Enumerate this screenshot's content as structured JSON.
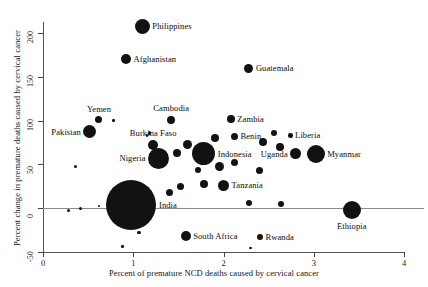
{
  "chart_data": {
    "type": "scatter",
    "title": "",
    "xlabel": "Percent of premature NCD deaths caused by cervical cancer",
    "ylabel": "Percent change in premature deaths caused by cervical cancer",
    "xlim": [
      0,
      4
    ],
    "ylim": [
      -50,
      200
    ],
    "xticks": [
      "0",
      "1",
      "2",
      "3",
      "4"
    ],
    "yticks": [
      "-50",
      "0",
      "50",
      "100",
      "150",
      "200"
    ],
    "grid": false,
    "legend": "none",
    "reference_line_y": 0,
    "marker_color": "#121212",
    "bubble_size_encodes": "population",
    "points": [
      {
        "label": "Philippines",
        "x": 1.1,
        "y": 208,
        "r": 7.5,
        "label_pos": "right"
      },
      {
        "label": "Afghanistan",
        "x": 0.92,
        "y": 170,
        "r": 5.0,
        "label_pos": "right"
      },
      {
        "label": "Guatemala",
        "x": 2.28,
        "y": 160,
        "r": 4.5,
        "label_pos": "right"
      },
      {
        "label": "Yemen",
        "x": 0.62,
        "y": 101,
        "r": 3.5,
        "label_pos": "above"
      },
      {
        "label": "Pakistan",
        "x": 0.52,
        "y": 87,
        "r": 6.5,
        "label_pos": "left"
      },
      {
        "label": "Cambodia",
        "x": 1.42,
        "y": 101,
        "r": 4.0,
        "label_pos": "above"
      },
      {
        "label": "Zambia",
        "x": 2.08,
        "y": 102,
        "r": 4.0,
        "label_pos": "right"
      },
      {
        "label": "Benin",
        "x": 2.12,
        "y": 82,
        "r": 3.5,
        "label_pos": "right"
      },
      {
        "label": "Liberia",
        "x": 2.74,
        "y": 83,
        "r": 2.2,
        "label_pos": "right"
      },
      {
        "label": "Burkina Faso",
        "x": 1.22,
        "y": 72,
        "r": 5.0,
        "label_pos": "above"
      },
      {
        "label": "Nigeria",
        "x": 1.28,
        "y": 57,
        "r": 10.5,
        "label_pos": "left"
      },
      {
        "label": "Indonesia",
        "x": 1.78,
        "y": 62,
        "r": 11.5,
        "label_pos": "right"
      },
      {
        "label": "Uganda",
        "x": 2.8,
        "y": 62,
        "r": 5.5,
        "label_pos": "left"
      },
      {
        "label": "Myanmar",
        "x": 3.02,
        "y": 62,
        "r": 9.0,
        "label_pos": "right"
      },
      {
        "label": "Tanzania",
        "x": 2.0,
        "y": 26,
        "r": 5.5,
        "label_pos": "right"
      },
      {
        "label": "India",
        "x": 0.98,
        "y": 3,
        "r": 25.0,
        "label_pos": "right"
      },
      {
        "label": "Ethiopia",
        "x": 3.42,
        "y": -2,
        "r": 9.0,
        "label_pos": "below"
      },
      {
        "label": "South Africa",
        "x": 1.58,
        "y": -32,
        "r": 5.0,
        "label_pos": "right"
      },
      {
        "label": "Rwanda",
        "x": 2.4,
        "y": -33,
        "r": 3.2,
        "label_pos": "right"
      },
      {
        "label": "",
        "x": 0.78,
        "y": 100,
        "r": 1.2,
        "label_pos": "right"
      },
      {
        "label": "",
        "x": 1.18,
        "y": 86,
        "r": 1.8,
        "label_pos": "right"
      },
      {
        "label": "",
        "x": 1.15,
        "y": 83,
        "r": 1.2,
        "label_pos": "right"
      },
      {
        "label": "",
        "x": 1.6,
        "y": 73,
        "r": 4.5,
        "label_pos": "right"
      },
      {
        "label": "",
        "x": 1.48,
        "y": 63,
        "r": 4.0,
        "label_pos": "right"
      },
      {
        "label": "",
        "x": 1.9,
        "y": 80,
        "r": 4.0,
        "label_pos": "right"
      },
      {
        "label": "",
        "x": 2.44,
        "y": 76,
        "r": 4.0,
        "label_pos": "right"
      },
      {
        "label": "",
        "x": 2.56,
        "y": 86,
        "r": 3.0,
        "label_pos": "right"
      },
      {
        "label": "",
        "x": 2.62,
        "y": 70,
        "r": 4.0,
        "label_pos": "right"
      },
      {
        "label": "",
        "x": 1.95,
        "y": 48,
        "r": 4.5,
        "label_pos": "right"
      },
      {
        "label": "",
        "x": 1.72,
        "y": 44,
        "r": 3.0,
        "label_pos": "right"
      },
      {
        "label": "",
        "x": 2.12,
        "y": 52,
        "r": 3.5,
        "label_pos": "right"
      },
      {
        "label": "",
        "x": 2.4,
        "y": 43,
        "r": 3.5,
        "label_pos": "right"
      },
      {
        "label": "",
        "x": 1.78,
        "y": 27,
        "r": 4.0,
        "label_pos": "right"
      },
      {
        "label": "",
        "x": 1.52,
        "y": 25,
        "r": 3.5,
        "label_pos": "right"
      },
      {
        "label": "",
        "x": 2.28,
        "y": 6,
        "r": 3.0,
        "label_pos": "right"
      },
      {
        "label": "",
        "x": 2.64,
        "y": 5,
        "r": 3.0,
        "label_pos": "right"
      },
      {
        "label": "",
        "x": 1.4,
        "y": 18,
        "r": 3.5,
        "label_pos": "right"
      },
      {
        "label": "",
        "x": 0.62,
        "y": 2,
        "r": 1.2,
        "label_pos": "right"
      },
      {
        "label": "",
        "x": 0.42,
        "y": 0,
        "r": 1.5,
        "label_pos": "right"
      },
      {
        "label": "",
        "x": 0.28,
        "y": -3,
        "r": 1.5,
        "label_pos": "right"
      },
      {
        "label": "",
        "x": 0.36,
        "y": 48,
        "r": 1.5,
        "label_pos": "right"
      },
      {
        "label": "",
        "x": 1.06,
        "y": -28,
        "r": 1.8,
        "label_pos": "right"
      },
      {
        "label": "",
        "x": 0.88,
        "y": -44,
        "r": 1.2,
        "label_pos": "right"
      },
      {
        "label": "",
        "x": 2.3,
        "y": -46,
        "r": 1.2,
        "label_pos": "right"
      }
    ]
  },
  "axis": {
    "x_title": "Percent of premature NCD deaths caused by cervical cancer",
    "y_title": "Percent change in premature deaths caused by cervical cancer",
    "x_ticks": [
      "0",
      "1",
      "2",
      "3",
      "4"
    ],
    "y_ticks": [
      "-50",
      "0",
      "50",
      "100",
      "150",
      "200"
    ]
  }
}
